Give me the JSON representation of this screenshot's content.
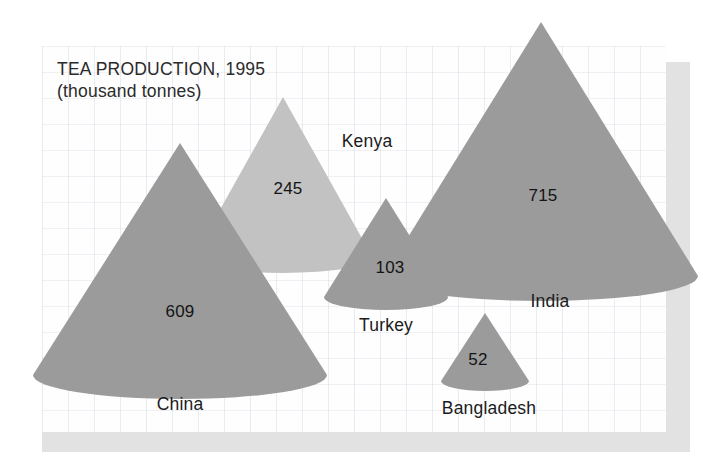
{
  "chart_data": {
    "type": "bar",
    "title": "TEA PRODUCTION, 1995",
    "subtitle": "(thousand tonnes)",
    "units": "thousand tonnes",
    "year": "1995",
    "xlabel": "",
    "ylabel": "",
    "categories": [
      "China",
      "Kenya",
      "Turkey",
      "India",
      "Bangladesh"
    ],
    "values": [
      609,
      245,
      103,
      715,
      52
    ],
    "value_labels": [
      "609",
      "245",
      "103",
      "715",
      "52"
    ],
    "grid": true,
    "legend": "none",
    "glyph": "cone",
    "note": "Each country is drawn as a 3D cone whose size is proportional to its tea production."
  },
  "chart": {
    "title": "TEA PRODUCTION, 1995",
    "subtitle": "(thousand tonnes)",
    "cones": [
      {
        "name": "China",
        "label": "China",
        "value_label": "609",
        "value": 609,
        "color": "#9b9b9b",
        "apex_x": 180,
        "apex_y": 143,
        "base_cx": 180,
        "base_cy": 375,
        "rx": 147,
        "ry": 24,
        "value_x": 180,
        "value_y": 312,
        "label_x": 180,
        "label_y": 394
      },
      {
        "name": "Kenya",
        "label": "Kenya",
        "value_label": "245",
        "value": 245,
        "color": "#c2c2c2",
        "apex_x": 283,
        "apex_y": 97,
        "base_cx": 283,
        "base_cy": 258,
        "rx": 90,
        "ry": 15,
        "value_x": 288,
        "value_y": 189,
        "label_x": 367,
        "label_y": 131
      },
      {
        "name": "India",
        "label": "India",
        "value_label": "715",
        "value": 715,
        "color": "#9b9b9b",
        "apex_x": 541,
        "apex_y": 22,
        "base_cx": 541,
        "base_cy": 276,
        "rx": 157,
        "ry": 25,
        "value_x": 543,
        "value_y": 196,
        "label_x": 550,
        "label_y": 291
      },
      {
        "name": "Turkey",
        "label": "Turkey",
        "value_label": "103",
        "value": 103,
        "color": "#9b9b9b",
        "apex_x": 386,
        "apex_y": 198,
        "base_cx": 386,
        "base_cy": 297,
        "rx": 62,
        "ry": 13,
        "value_x": 390,
        "value_y": 268,
        "label_x": 386,
        "label_y": 315
      },
      {
        "name": "Bangladesh",
        "label": "Bangladesh",
        "value_label": "52",
        "value": 52,
        "color": "#9b9b9b",
        "apex_x": 485,
        "apex_y": 313,
        "base_cx": 485,
        "base_cy": 381,
        "rx": 44,
        "ry": 10,
        "value_x": 478,
        "value_y": 360,
        "label_x": 489,
        "label_y": 398
      }
    ]
  },
  "colors": {
    "cone_dark": "#9b9b9b",
    "cone_light": "#c2c2c2",
    "panel_shadow": "#e2e2e2",
    "grid_line": "#96a5b9",
    "text": "#1b1b1b",
    "background": "#ffffff"
  }
}
